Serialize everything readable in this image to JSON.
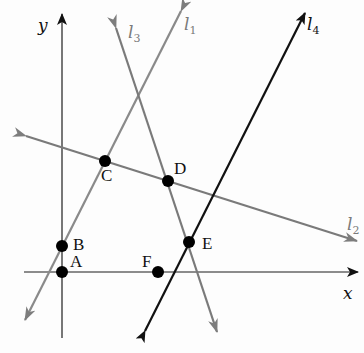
{
  "diagram": {
    "axes": {
      "x_label": "x",
      "y_label": "y"
    },
    "lines": [
      {
        "id": "l1",
        "name": "l",
        "subscript": "1",
        "color": "#8a8a8a"
      },
      {
        "id": "l2",
        "name": "l",
        "subscript": "2",
        "color": "#7a7a7a"
      },
      {
        "id": "l3",
        "name": "l",
        "subscript": "3",
        "color": "#7a7a7a"
      },
      {
        "id": "l4",
        "name": "l",
        "subscript": "4",
        "color": "#111111"
      }
    ],
    "points": [
      {
        "label": "A",
        "on": [
          "x-axis",
          "y-axis"
        ]
      },
      {
        "label": "B",
        "on": [
          "y-axis",
          "l1"
        ]
      },
      {
        "label": "C",
        "on": [
          "l1",
          "l2"
        ]
      },
      {
        "label": "D",
        "on": [
          "l2",
          "l3"
        ]
      },
      {
        "label": "E",
        "on": [
          "l3",
          "l4"
        ]
      },
      {
        "label": "F",
        "on": [
          "l4",
          "x-axis"
        ]
      }
    ],
    "colors": {
      "axis": "#555555",
      "gray_line": "#808080",
      "black_line": "#111111",
      "point": "#000000"
    }
  }
}
